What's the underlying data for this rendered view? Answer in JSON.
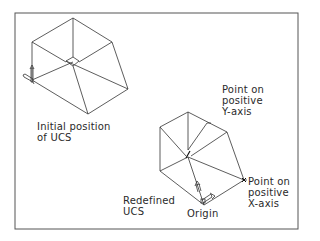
{
  "figure": {
    "colors": {
      "line": "#333333",
      "frame": "#555555",
      "background": "#ffffff"
    }
  },
  "labels": {
    "initial_ucs": [
      "Initial position",
      "of UCS"
    ],
    "point_y": [
      "Point on",
      "positive",
      "Y-axis"
    ],
    "redefined_ucs": [
      "Redefined",
      "UCS"
    ],
    "origin": "Origin",
    "point_x": [
      "Point on",
      "positive",
      "X-axis"
    ]
  }
}
